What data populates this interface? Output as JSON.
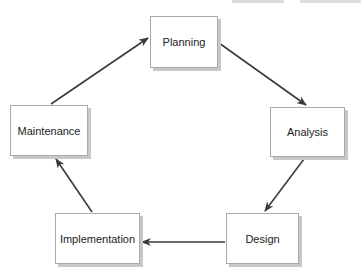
{
  "diagram": {
    "type": "cycle",
    "header_fragment": "",
    "nodes": [
      {
        "id": "planning",
        "label": "Planning"
      },
      {
        "id": "analysis",
        "label": "Analysis"
      },
      {
        "id": "design",
        "label": "Design"
      },
      {
        "id": "implementation",
        "label": "Implementation"
      },
      {
        "id": "maintenance",
        "label": "Maintenance"
      }
    ],
    "edges": [
      {
        "from": "planning",
        "to": "analysis"
      },
      {
        "from": "analysis",
        "to": "design"
      },
      {
        "from": "design",
        "to": "implementation"
      },
      {
        "from": "implementation",
        "to": "maintenance"
      },
      {
        "from": "maintenance",
        "to": "planning"
      }
    ],
    "colors": {
      "arrow": "#3a3a3a",
      "box_border": "#a9a9a9",
      "box_shadow": "#c8c8c8",
      "text": "#222222"
    }
  }
}
